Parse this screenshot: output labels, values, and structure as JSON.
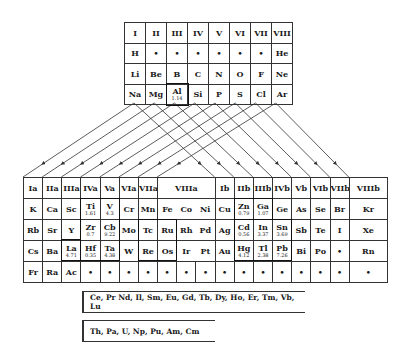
{
  "upper_table": {
    "headers": [
      "I",
      "II",
      "III",
      "IV",
      "V",
      "VI",
      "VII",
      "VIII"
    ],
    "rows": [
      [
        {
          "s": "H"
        },
        {
          "s": "•"
        },
        {
          "s": "•"
        },
        {
          "s": "•"
        },
        {
          "s": "•"
        },
        {
          "s": "•"
        },
        {
          "s": "•"
        },
        {
          "s": "He"
        }
      ],
      [
        {
          "s": "Li"
        },
        {
          "s": "Be"
        },
        {
          "s": "B"
        },
        {
          "s": "C"
        },
        {
          "s": "N"
        },
        {
          "s": "O"
        },
        {
          "s": "F"
        },
        {
          "s": "Ne"
        }
      ],
      [
        {
          "s": "Na"
        },
        {
          "s": "Mg"
        },
        {
          "s": "Al",
          "n": "1.14"
        },
        {
          "s": "Si"
        },
        {
          "s": "P"
        },
        {
          "s": "S"
        },
        {
          "s": "Cl"
        },
        {
          "s": "Ar"
        }
      ]
    ]
  },
  "lower_table": {
    "headers": [
      {
        "label": "Ia",
        "span": 1
      },
      {
        "label": "IIa",
        "span": 1
      },
      {
        "label": "IIIa",
        "span": 1
      },
      {
        "label": "IVa",
        "span": 1
      },
      {
        "label": "Va",
        "span": 1
      },
      {
        "label": "VIa",
        "span": 1
      },
      {
        "label": "VIIa",
        "span": 1
      },
      {
        "label": "VIIIa",
        "span": 3
      },
      {
        "label": "Ib",
        "span": 1
      },
      {
        "label": "IIb",
        "span": 1
      },
      {
        "label": "IIIb",
        "span": 1
      },
      {
        "label": "IVb",
        "span": 1
      },
      {
        "label": "Vb",
        "span": 1
      },
      {
        "label": "VIb",
        "span": 1
      },
      {
        "label": "VIIb",
        "span": 1
      },
      {
        "label": "VIIIb",
        "span": 1
      }
    ],
    "rows": [
      [
        {
          "s": "K"
        },
        {
          "s": "Ca"
        },
        {
          "s": "Sc"
        },
        {
          "s": "Ti",
          "n": "1.61"
        },
        {
          "s": "V",
          "n": "4.3"
        },
        {
          "s": "Cr"
        },
        {
          "s": "Mn"
        },
        {
          "s": "Fe"
        },
        {
          "s": "Co"
        },
        {
          "s": "Ni"
        },
        {
          "s": "Cu"
        },
        {
          "s": "Zn",
          "n": "0.79"
        },
        {
          "s": "Ga",
          "n": "1.07"
        },
        {
          "s": "Ge"
        },
        {
          "s": "As"
        },
        {
          "s": "Se"
        },
        {
          "s": "Br"
        },
        {
          "s": "Kr"
        }
      ],
      [
        {
          "s": "Rb"
        },
        {
          "s": "Sr"
        },
        {
          "s": "Y"
        },
        {
          "s": "Zr",
          "n": "0.7"
        },
        {
          "s": "Cb",
          "n": "9.22"
        },
        {
          "s": "Mo"
        },
        {
          "s": "Tc"
        },
        {
          "s": "Ru"
        },
        {
          "s": "Rh"
        },
        {
          "s": "Pd"
        },
        {
          "s": "Ag"
        },
        {
          "s": "Cd",
          "n": "0.56"
        },
        {
          "s": "In",
          "n": "3.37"
        },
        {
          "s": "Sn",
          "n": "3.69"
        },
        {
          "s": "Sb"
        },
        {
          "s": "Te"
        },
        {
          "s": "I"
        },
        {
          "s": "Xe"
        }
      ],
      [
        {
          "s": "Cs"
        },
        {
          "s": "Ba"
        },
        {
          "s": "La",
          "n": "4.71"
        },
        {
          "s": "Hf",
          "n": "0.35"
        },
        {
          "s": "Ta",
          "n": "4.38"
        },
        {
          "s": "W"
        },
        {
          "s": "Re"
        },
        {
          "s": "Os"
        },
        {
          "s": "Ir"
        },
        {
          "s": "Pt"
        },
        {
          "s": "Au"
        },
        {
          "s": "Hg",
          "n": "4.12"
        },
        {
          "s": "Tl",
          "n": "2.38"
        },
        {
          "s": "Pb",
          "n": "7.26"
        },
        {
          "s": "Bi"
        },
        {
          "s": "Po"
        },
        {
          "s": "•"
        },
        {
          "s": "Rn"
        }
      ],
      [
        {
          "s": "Fr"
        },
        {
          "s": "Ra"
        },
        {
          "s": "Ac"
        },
        {
          "s": "•"
        },
        {
          "s": "•"
        },
        {
          "s": "•"
        },
        {
          "s": "•"
        },
        {
          "s": "•"
        },
        {
          "s": "•"
        },
        {
          "s": "•"
        },
        {
          "s": "•"
        },
        {
          "s": "•"
        },
        {
          "s": "•"
        },
        {
          "s": "•"
        },
        {
          "s": "•"
        },
        {
          "s": "•"
        },
        {
          "s": "•"
        },
        {
          "s": "•"
        }
      ]
    ]
  },
  "lanthanides": "Ce, Pr Nd, Il, Sm, Eu, Gd, Tb, Dy, Ho, Er, Tm, Vb, Lu",
  "actinides": "Th, Pa, U, Np, Pu, Am, Cm"
}
